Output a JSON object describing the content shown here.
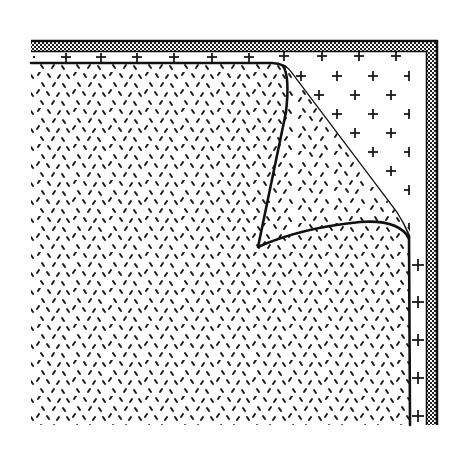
{
  "illustration": {
    "subject": "page-curl-corner",
    "colors": {
      "background": "#ffffff",
      "ink": "#1a1a1a",
      "checker_light": "#ffffff",
      "checker_dark": "#222222"
    },
    "frame": {
      "outer_left": 31,
      "outer_top": 40,
      "outer_right": 438,
      "outer_bottom": 425,
      "band_width": 12
    },
    "inner_border": {
      "top_y": 63,
      "right_x": 410
    },
    "curl": {
      "top_start": [
        272,
        63
      ],
      "outer_edge_end": [
        409,
        234
      ],
      "fold_tip": [
        258,
        247
      ],
      "inner_top": [
        283,
        68
      ],
      "inner_right": [
        409,
        240
      ]
    },
    "fills": {
      "page_pattern": "short-dashes",
      "revealed_pattern": "plus-marks",
      "frame_pattern": "checker"
    }
  }
}
